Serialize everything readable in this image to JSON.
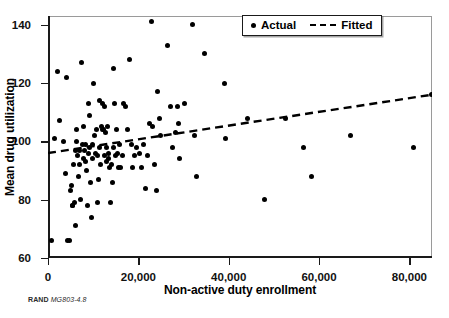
{
  "figure": {
    "source_note_brand": "RAND",
    "source_note_ident": "MG803-4.8"
  },
  "legend": {
    "position": "top-right",
    "entries": [
      {
        "label": "Actual",
        "marker": "filled-circle",
        "color": "#000000"
      },
      {
        "label": "Fitted",
        "marker": "dashed-line",
        "color": "#000000"
      }
    ]
  },
  "chart_data": {
    "type": "scatter",
    "title": "",
    "subtitle": "",
    "xlabel": "Non-active duty enrollment",
    "ylabel": "Mean drug utilization",
    "xlim": [
      0,
      85000
    ],
    "ylim": [
      60,
      143
    ],
    "grid": false,
    "legend_position": "top-right",
    "xticks": [
      0,
      20000,
      40000,
      60000,
      80000
    ],
    "xticklabels": [
      "0",
      "20,000",
      "40,000",
      "60,000",
      "80,000"
    ],
    "yticks": [
      60,
      80,
      100,
      120,
      140
    ],
    "yticklabels": [
      "60",
      "80",
      "100",
      "120",
      "140"
    ],
    "series": [
      {
        "name": "Actual",
        "type": "scatter",
        "marker": "filled-circle",
        "color": "#000000",
        "points": [
          [
            700,
            66
          ],
          [
            1400,
            101
          ],
          [
            2200,
            124
          ],
          [
            2600,
            107
          ],
          [
            3400,
            100
          ],
          [
            3900,
            89
          ],
          [
            4100,
            122
          ],
          [
            4300,
            66
          ],
          [
            4700,
            66
          ],
          [
            4900,
            83
          ],
          [
            5100,
            85
          ],
          [
            5400,
            78
          ],
          [
            5500,
            78
          ],
          [
            5700,
            92
          ],
          [
            5900,
            79
          ],
          [
            6000,
            97
          ],
          [
            6100,
            71
          ],
          [
            6200,
            100
          ],
          [
            6400,
            104
          ],
          [
            6600,
            95
          ],
          [
            6800,
            88
          ],
          [
            6900,
            97
          ],
          [
            7000,
            92
          ],
          [
            7200,
            80
          ],
          [
            7400,
            127
          ],
          [
            7600,
            99
          ],
          [
            7800,
            94
          ],
          [
            7900,
            105
          ],
          [
            8000,
            97
          ],
          [
            8200,
            99
          ],
          [
            8400,
            93
          ],
          [
            8600,
            90
          ],
          [
            8800,
            78
          ],
          [
            8900,
            113
          ],
          [
            9000,
            96
          ],
          [
            9100,
            98
          ],
          [
            9200,
            109
          ],
          [
            9400,
            86
          ],
          [
            9600,
            74
          ],
          [
            9800,
            94
          ],
          [
            9900,
            99
          ],
          [
            10000,
            144
          ],
          [
            10100,
            120
          ],
          [
            10300,
            102
          ],
          [
            10500,
            96
          ],
          [
            10700,
            104
          ],
          [
            10900,
            79
          ],
          [
            11000,
            95
          ],
          [
            11200,
            87
          ],
          [
            11300,
            114
          ],
          [
            11500,
            98
          ],
          [
            11700,
            92
          ],
          [
            11900,
            105
          ],
          [
            12000,
            113
          ],
          [
            12100,
            104
          ],
          [
            12300,
            104
          ],
          [
            12400,
            112
          ],
          [
            12600,
            95
          ],
          [
            12800,
            103
          ],
          [
            12900,
            98
          ],
          [
            13000,
            93
          ],
          [
            13100,
            105
          ],
          [
            13300,
            94
          ],
          [
            13500,
            96
          ],
          [
            13600,
            91
          ],
          [
            13800,
            79
          ],
          [
            14000,
            92
          ],
          [
            14200,
            86
          ],
          [
            14400,
            125
          ],
          [
            14600,
            98
          ],
          [
            14800,
            113
          ],
          [
            15000,
            95
          ],
          [
            15200,
            104
          ],
          [
            15400,
            96
          ],
          [
            15600,
            91
          ],
          [
            15900,
            99
          ],
          [
            16100,
            91
          ],
          [
            16400,
            95
          ],
          [
            16800,
            113
          ],
          [
            17200,
            112
          ],
          [
            17600,
            104
          ],
          [
            18000,
            128
          ],
          [
            18400,
            99
          ],
          [
            18800,
            91
          ],
          [
            19200,
            95
          ],
          [
            19600,
            98
          ],
          [
            20200,
            96
          ],
          [
            20800,
            91
          ],
          [
            21200,
            99
          ],
          [
            21600,
            84
          ],
          [
            22000,
            95
          ],
          [
            22400,
            106
          ],
          [
            22800,
            141
          ],
          [
            23200,
            105
          ],
          [
            23600,
            92
          ],
          [
            24000,
            83
          ],
          [
            24200,
            117
          ],
          [
            24600,
            108
          ],
          [
            25000,
            102
          ],
          [
            26400,
            133
          ],
          [
            27200,
            112
          ],
          [
            27600,
            98
          ],
          [
            28200,
            103
          ],
          [
            28600,
            112
          ],
          [
            28800,
            106
          ],
          [
            29000,
            94
          ],
          [
            30200,
            113
          ],
          [
            32000,
            140
          ],
          [
            32400,
            102
          ],
          [
            32800,
            88
          ],
          [
            34600,
            130
          ],
          [
            39000,
            120
          ],
          [
            39400,
            101
          ],
          [
            44200,
            108
          ],
          [
            48000,
            80
          ],
          [
            52600,
            108
          ],
          [
            56600,
            98
          ],
          [
            58400,
            88
          ],
          [
            67000,
            102
          ],
          [
            81000,
            98
          ],
          [
            84800,
            116
          ]
        ]
      },
      {
        "name": "Fitted",
        "type": "line",
        "style": "dashed",
        "color": "#000000",
        "x": [
          0,
          85000
        ],
        "y": [
          96,
          116
        ]
      }
    ]
  }
}
